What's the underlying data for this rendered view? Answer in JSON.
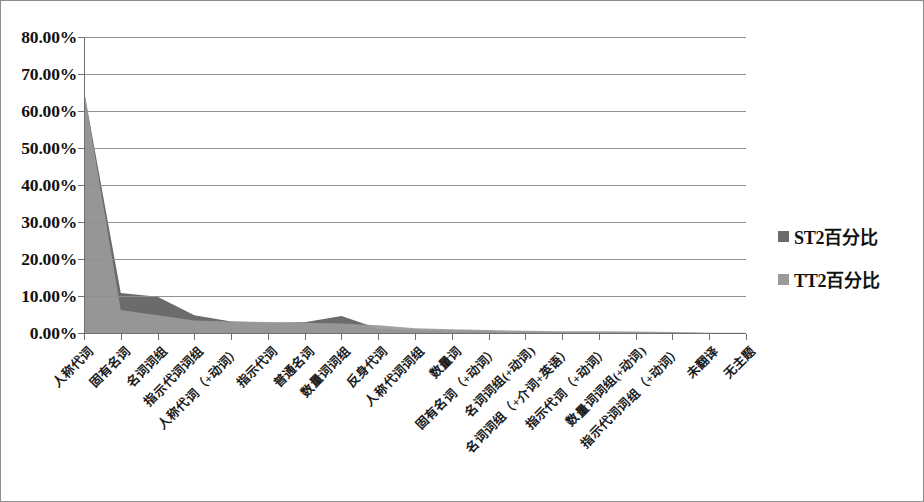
{
  "chart_data": {
    "type": "area",
    "title": "",
    "xlabel": "",
    "ylabel": "",
    "ylim": [
      0,
      0.8
    ],
    "ytick_labels": [
      "80.00%",
      "70.00%",
      "60.00%",
      "50.00%",
      "40.00%",
      "30.00%",
      "20.00%",
      "10.00%",
      "0.00%"
    ],
    "ytick_values": [
      0.8,
      0.7,
      0.6,
      0.5,
      0.4,
      0.3,
      0.2,
      0.1,
      0.0
    ],
    "grid": true,
    "legend_position": "right",
    "categories": [
      "人称代词",
      "固有名词",
      "名词词组",
      "指示代词词组",
      "人称代词（+动词）",
      "指示代词",
      "普通名词",
      "数量词词组",
      "反身代词",
      "人称代词词组",
      "数量词",
      "固有名词（+动词）",
      "名词词组(+动词)",
      "名词词组（+介词+英语）",
      "指示代词（+动词）",
      "数量词词组(+动词)",
      "指示代词词组（+动词）",
      "未翻译",
      "无主题"
    ],
    "series": [
      {
        "name": "ST2百分比",
        "color": "#6b6b6b",
        "values": [
          0.655,
          0.108,
          0.098,
          0.048,
          0.031,
          0.028,
          0.029,
          0.046,
          0.012,
          0.008,
          0.006,
          0.004,
          0.003,
          0.002,
          0.002,
          0.0015,
          0.001,
          0.0,
          0.0
        ]
      },
      {
        "name": "TT2百分比",
        "color": "#9a9a9a",
        "values": [
          0.655,
          0.062,
          0.048,
          0.034,
          0.031,
          0.03,
          0.028,
          0.026,
          0.021,
          0.013,
          0.01,
          0.008,
          0.006,
          0.005,
          0.005,
          0.004,
          0.003,
          0.001,
          0.0005
        ]
      }
    ]
  },
  "legend": {
    "items": [
      {
        "label": "ST2百分比",
        "color": "#6b6b6b"
      },
      {
        "label": "TT2百分比",
        "color": "#9a9a9a"
      }
    ]
  }
}
